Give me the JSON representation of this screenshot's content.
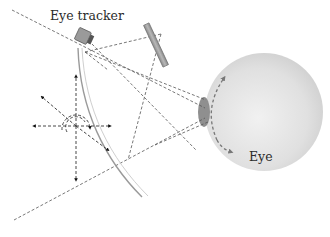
{
  "diagram": {
    "labels": {
      "eye_tracker": "Eye tracker",
      "eye": "Eye"
    },
    "components": [
      {
        "name": "eye-tracker",
        "shape": "tilted camera box",
        "color": "#9a9a9a"
      },
      {
        "name": "reflector",
        "shape": "tilted bar",
        "color": "#a6a6a6"
      },
      {
        "name": "windshield",
        "shape": "curved double line",
        "color": "#9e9e9e"
      },
      {
        "name": "eyeball",
        "shape": "sphere",
        "color": "#e2e2e2"
      },
      {
        "name": "cornea",
        "shape": "ellipse",
        "color": "#8c8c8c"
      },
      {
        "name": "head-movement-axes",
        "shape": "dashed arrows in 6 directions with rotation arcs"
      },
      {
        "name": "eye-rotation-arrow",
        "shape": "dashed curved double arrow"
      }
    ],
    "colors": {
      "line": "#555555",
      "arrow": "#111111",
      "eyeball": "#e2e2e2",
      "cornea": "#8c8c8c",
      "device": "#9a9a9a"
    }
  }
}
